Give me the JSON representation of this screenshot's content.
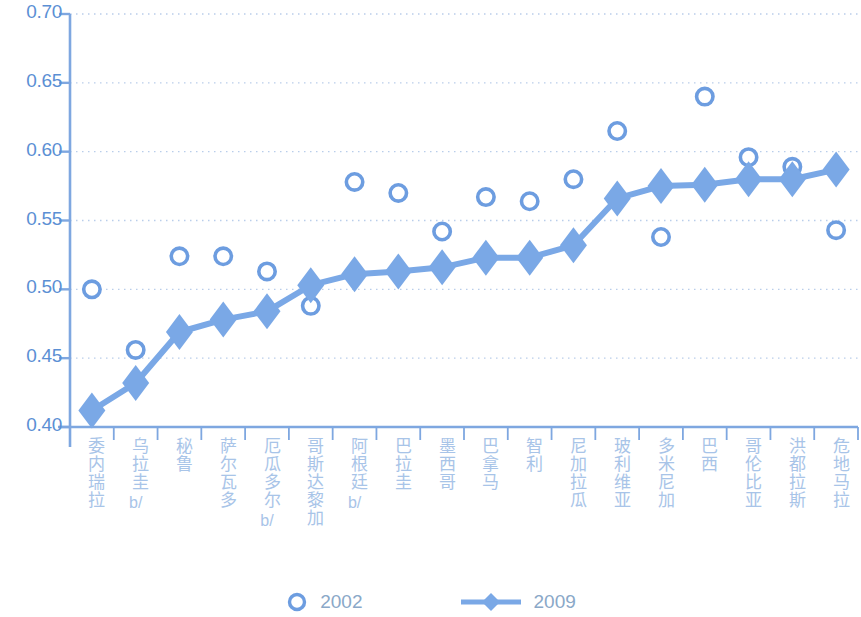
{
  "chart_data": {
    "type": "scatter",
    "title": "",
    "xlabel": "",
    "ylabel": "",
    "ylim": [
      0.4,
      0.7
    ],
    "ytick_labels": [
      "0.70",
      "0.65",
      "0.60",
      "0.55",
      "0.50",
      "0.45",
      "0.40"
    ],
    "ytick_values": [
      0.7,
      0.65,
      0.6,
      0.55,
      0.5,
      0.45,
      0.4
    ],
    "grid": true,
    "legend_position": "bottom",
    "categories": [
      "委内瑞拉",
      "乌拉圭",
      "秘鲁",
      "萨尔瓦多",
      "厄瓜多尔",
      "哥斯达黎加",
      "阿根廷",
      "巴拉圭",
      "墨西哥",
      "巴拿马",
      "智利",
      "尼加拉瓜",
      "玻利维亚",
      "多米尼加",
      "巴西",
      "哥伦比亚",
      "洪都拉斯",
      "危地马拉"
    ],
    "category_notes": [
      "",
      "b/",
      "",
      "",
      "b/",
      "",
      "b/",
      "",
      "",
      "",
      "",
      "",
      "",
      "",
      "",
      "",
      "",
      ""
    ],
    "series": [
      {
        "name": "2002",
        "marker": "open-circle",
        "line": false,
        "color": "#6d9de0",
        "values": [
          0.5,
          0.456,
          0.524,
          0.524,
          0.513,
          0.488,
          0.578,
          0.57,
          0.542,
          0.567,
          0.564,
          0.58,
          0.615,
          0.538,
          0.64,
          0.596,
          0.589,
          0.543
        ]
      },
      {
        "name": "2009",
        "marker": "filled-diamond",
        "line": true,
        "color": "#7aa8e6",
        "values": [
          0.412,
          0.432,
          0.469,
          0.478,
          0.484,
          0.503,
          0.511,
          0.513,
          0.516,
          0.523,
          0.523,
          0.532,
          0.566,
          0.575,
          0.576,
          0.58,
          0.58,
          0.587
        ]
      }
    ]
  },
  "legend": {
    "items": [
      {
        "label": "2002",
        "marker": "open-circle"
      },
      {
        "label": "2009",
        "marker": "filled-diamond"
      }
    ]
  },
  "colors": {
    "series_2002": "#6d9de0",
    "series_2009": "#7aa8e6",
    "axis": "#7ea7e0",
    "grid": "#b9cdea",
    "ytick_text": "#5b8fd4",
    "xtick_text": "#a8c4e8",
    "legend_text": "#8aa8c8",
    "background": "#ffffff"
  }
}
